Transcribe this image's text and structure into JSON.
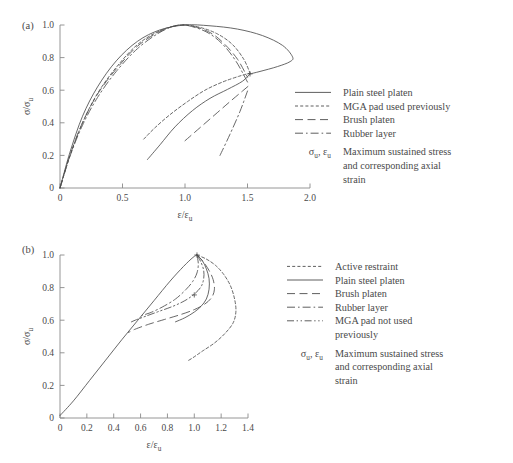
{
  "figure": {
    "panels": [
      {
        "id": "a",
        "label": "(a)",
        "xlabel_num": "ε/ε",
        "xlabel_sub": "u",
        "ylabel_num": "σ/σ",
        "ylabel_sub": "u",
        "xticks": [
          "0",
          "0.5",
          "1.0",
          "1.5",
          "2.0"
        ],
        "yticks": [
          "0",
          "0.2",
          "0.4",
          "0.6",
          "0.8",
          "1.0"
        ],
        "legend": [
          {
            "style": "solid",
            "label": "Plain steel platen"
          },
          {
            "style": "dotted",
            "label": "MGA pad used previously"
          },
          {
            "style": "longdash",
            "label": "Brush platen"
          },
          {
            "style": "dashdot",
            "label": "Rubber layer"
          }
        ],
        "legend_note": {
          "symbol_a": "σ",
          "symbol_a_sub": "u",
          "symbol_b": "ε",
          "symbol_b_sub": "u",
          "lines": [
            "Maximum sustained stress",
            "and corresponding axial",
            "strain"
          ]
        }
      },
      {
        "id": "b",
        "label": "(b)",
        "xlabel_num": "ε/ε",
        "xlabel_sub": "u",
        "ylabel_num": "σ/σ",
        "ylabel_sub": "u",
        "xticks": [
          "0",
          "0.2",
          "0.4",
          "0.6",
          "0.8",
          "1.0",
          "1.2",
          "1.4"
        ],
        "yticks": [
          "0",
          "0.2",
          "0.4",
          "0.6",
          "0.8",
          "1.0"
        ],
        "legend": [
          {
            "style": "dotted",
            "label": "Active restraint"
          },
          {
            "style": "solid",
            "label": "Plain steel platen"
          },
          {
            "style": "longdash",
            "label": "Brush platen"
          },
          {
            "style": "dashdot",
            "label": "Rubber layer"
          },
          {
            "style": "dashdotdot",
            "label": "MGA pad not used",
            "label2": "previously"
          }
        ],
        "legend_note": {
          "symbol_a": "σ",
          "symbol_a_sub": "u",
          "symbol_b": "ε",
          "symbol_b_sub": "u",
          "lines": [
            "Maximum sustained stress",
            "and corresponding axial",
            "strain"
          ]
        }
      }
    ]
  },
  "chart_data": [
    {
      "id": "a",
      "type": "line",
      "title": "",
      "xlabel": "ε/ε_u",
      "ylabel": "σ/σ_u",
      "xlim": [
        0,
        2.0
      ],
      "ylim": [
        0,
        1.0
      ],
      "xticks": [
        0,
        0.5,
        1.0,
        1.5,
        2.0
      ],
      "yticks": [
        0,
        0.2,
        0.4,
        0.6,
        0.8,
        1.0
      ],
      "grid": false,
      "legend_position": "right",
      "series": [
        {
          "name": "Plain steel platen",
          "style": "solid",
          "x": [
            0.0,
            0.08,
            0.18,
            0.3,
            0.45,
            0.62,
            0.8,
            1.0,
            1.2,
            1.42,
            1.62,
            1.78,
            1.86,
            1.84,
            1.74,
            1.6,
            1.52
          ],
          "y": [
            0.0,
            0.22,
            0.44,
            0.62,
            0.78,
            0.9,
            0.97,
            1.0,
            0.995,
            0.975,
            0.935,
            0.875,
            0.805,
            0.775,
            0.745,
            0.715,
            0.7
          ]
        },
        {
          "name": "Plain steel platen (unloading branch)",
          "style": "solid",
          "x": [
            0.7,
            0.8,
            0.92,
            1.06,
            1.2,
            1.34,
            1.46,
            1.52
          ],
          "y": [
            0.175,
            0.265,
            0.375,
            0.475,
            0.55,
            0.605,
            0.655,
            0.7
          ]
        },
        {
          "name": "MGA pad used previously",
          "style": "dotted",
          "x": [
            0.0,
            0.08,
            0.18,
            0.3,
            0.45,
            0.62,
            0.8,
            0.97,
            1.12,
            1.26,
            1.38,
            1.47,
            1.52
          ],
          "y": [
            0.0,
            0.2,
            0.4,
            0.58,
            0.74,
            0.88,
            0.965,
            1.0,
            0.985,
            0.945,
            0.88,
            0.79,
            0.705
          ]
        },
        {
          "name": "MGA pad used previously (unloading branch)",
          "style": "dotted",
          "x": [
            0.67,
            0.76,
            0.88,
            1.02,
            1.16,
            1.3,
            1.43,
            1.52
          ],
          "y": [
            0.3,
            0.37,
            0.45,
            0.53,
            0.6,
            0.65,
            0.685,
            0.705
          ]
        },
        {
          "name": "Brush platen",
          "style": "longdash",
          "x": [
            0.0,
            0.08,
            0.18,
            0.3,
            0.45,
            0.62,
            0.8,
            0.96,
            1.1,
            1.22,
            1.32,
            1.42,
            1.5
          ],
          "y": [
            0.0,
            0.2,
            0.4,
            0.575,
            0.73,
            0.87,
            0.96,
            1.0,
            0.985,
            0.945,
            0.88,
            0.79,
            0.68
          ]
        },
        {
          "name": "Brush platen (unloading branch)",
          "style": "longdash",
          "x": [
            1.0,
            1.12,
            1.24,
            1.36,
            1.46,
            1.53
          ],
          "y": [
            0.29,
            0.37,
            0.45,
            0.53,
            0.595,
            0.64
          ]
        },
        {
          "name": "Rubber layer",
          "style": "dashdot",
          "x": [
            0.0,
            0.08,
            0.18,
            0.3,
            0.45,
            0.62,
            0.8,
            0.95,
            1.08,
            1.2,
            1.31,
            1.41,
            1.5
          ],
          "y": [
            0.0,
            0.195,
            0.385,
            0.555,
            0.715,
            0.855,
            0.955,
            1.0,
            0.985,
            0.945,
            0.875,
            0.775,
            0.65
          ]
        },
        {
          "name": "Rubber layer (unloading branch)",
          "style": "dashdot",
          "x": [
            1.28,
            1.36,
            1.44,
            1.5
          ],
          "y": [
            0.2,
            0.33,
            0.47,
            0.595
          ]
        }
      ],
      "annotations": [
        {
          "type": "cross-marker",
          "x": 1.52,
          "y": 0.7,
          "note": "curve convergence point"
        }
      ]
    },
    {
      "id": "b",
      "type": "line",
      "title": "",
      "xlabel": "ε/ε_u",
      "ylabel": "σ/σ_u",
      "xlim": [
        0,
        1.4
      ],
      "ylim": [
        0,
        1.0
      ],
      "xticks": [
        0,
        0.2,
        0.4,
        0.6,
        0.8,
        1.0,
        1.2,
        1.4
      ],
      "yticks": [
        0,
        0.2,
        0.4,
        0.6,
        0.8,
        1.0
      ],
      "grid": false,
      "legend_position": "right",
      "series": [
        {
          "name": "Plain steel platen",
          "style": "solid",
          "x": [
            0.0,
            0.1,
            0.22,
            0.34,
            0.46,
            0.58,
            0.7,
            0.82,
            0.92,
            0.99,
            1.02
          ],
          "y": [
            0.015,
            0.105,
            0.23,
            0.355,
            0.48,
            0.6,
            0.72,
            0.84,
            0.93,
            0.985,
            1.0
          ]
        },
        {
          "name": "Plain steel platen (descending)",
          "style": "solid",
          "x": [
            1.02,
            1.06,
            1.09,
            1.11,
            1.11,
            1.09,
            1.05,
            1.0,
            0.93,
            0.86
          ],
          "y": [
            1.0,
            0.965,
            0.915,
            0.855,
            0.79,
            0.73,
            0.685,
            0.65,
            0.615,
            0.59
          ]
        },
        {
          "name": "Active restraint",
          "style": "dotted",
          "x": [
            1.02,
            1.09,
            1.16,
            1.22,
            1.27,
            1.3,
            1.31,
            1.29,
            1.23,
            1.15,
            1.06,
            0.99,
            0.95
          ],
          "y": [
            1.0,
            0.975,
            0.935,
            0.88,
            0.81,
            0.73,
            0.655,
            0.585,
            0.52,
            0.46,
            0.41,
            0.37,
            0.35
          ]
        },
        {
          "name": "Brush platen",
          "style": "longdash",
          "x": [
            1.02,
            1.07,
            1.11,
            1.14,
            1.15,
            1.13,
            1.08,
            1.0,
            0.9,
            0.78,
            0.66,
            0.56,
            0.51
          ],
          "y": [
            1.0,
            0.955,
            0.905,
            0.85,
            0.79,
            0.74,
            0.7,
            0.665,
            0.635,
            0.605,
            0.575,
            0.545,
            0.525
          ]
        },
        {
          "name": "Rubber layer",
          "style": "dashdot",
          "x": [
            1.02,
            1.03,
            1.02,
            0.99,
            0.94,
            0.86,
            0.76,
            0.67,
            0.61
          ],
          "y": [
            1.0,
            0.945,
            0.89,
            0.84,
            0.79,
            0.73,
            0.68,
            0.645,
            0.63
          ]
        },
        {
          "name": "MGA pad not used previously",
          "style": "dashdotdot",
          "x": [
            1.02,
            1.05,
            1.07,
            1.07,
            1.05,
            1.0,
            0.93,
            0.84,
            0.74,
            0.64,
            0.56,
            0.52
          ],
          "y": [
            1.0,
            0.955,
            0.905,
            0.855,
            0.805,
            0.76,
            0.72,
            0.685,
            0.655,
            0.625,
            0.6,
            0.585
          ]
        }
      ],
      "annotations": [
        {
          "type": "peak-marker",
          "x": 1.02,
          "y": 1.0,
          "note": "maximum sustained stress point"
        },
        {
          "type": "cross-marker",
          "x": 1.0,
          "y": 0.755,
          "note": "curve convergence point"
        }
      ]
    }
  ]
}
